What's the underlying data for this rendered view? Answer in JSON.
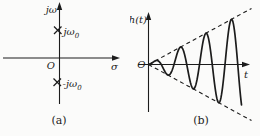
{
  "colors": {
    "ink": "#1c1c1c",
    "background": "#fbfbfa"
  },
  "figure": {
    "panel_a": {
      "type": "s-plane pole plot",
      "y_axis_label": "jω",
      "x_axis_label": "σ",
      "origin_label": "O",
      "poles": [
        {
          "label_main": "jω",
          "label_sub": "0"
        },
        {
          "label_main": "-jω",
          "label_sub": "0"
        }
      ],
      "caption": "(a)"
    },
    "panel_b": {
      "type": "impulse response sketch",
      "y_axis_label": "h(t)",
      "x_axis_label": "t",
      "origin_label": "O",
      "caption": "(b)",
      "waveform": {
        "description": "linearly growing oscillation with dashed straight-line envelopes",
        "x0": 18.5,
        "y0": 64.5,
        "slope": 0.545,
        "period": 25.5,
        "length": 93,
        "envelope_extent": 103
      }
    }
  }
}
